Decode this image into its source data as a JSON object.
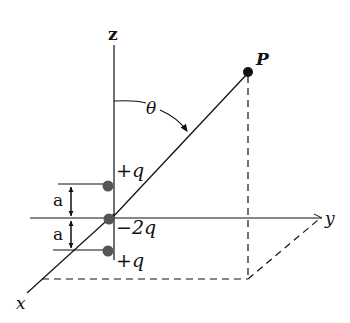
{
  "diagram": {
    "type": "physics-electric-quadrupole",
    "axes": {
      "x_label": "x",
      "y_label": "y",
      "z_label": "z"
    },
    "point": {
      "label": "P"
    },
    "angle": {
      "label": "θ"
    },
    "charges": [
      {
        "label": "+q",
        "position": "top"
      },
      {
        "label": "−2q",
        "position": "origin"
      },
      {
        "label": "+q",
        "position": "bottom"
      }
    ],
    "spacing": [
      {
        "label": "a"
      },
      {
        "label": "a"
      }
    ],
    "colors": {
      "line": "#111111",
      "charge": "#555555",
      "point": "#111111"
    }
  }
}
